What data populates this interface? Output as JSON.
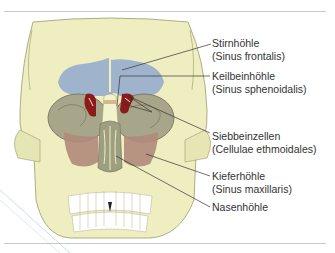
{
  "figure": {
    "labels": [
      {
        "id": "stirnhoehle",
        "name": "Stirnhöhle",
        "latin": "(Sinus frontalis)"
      },
      {
        "id": "keilbeinhoehle",
        "name": "Keilbeinhöhle",
        "latin": "(Sinus sphenoidalis)"
      },
      {
        "id": "siebbeinzellen",
        "name": "Siebbeinzellen",
        "latin": "(Cellulae ethmoidales)"
      },
      {
        "id": "kieferhoehle",
        "name": "Kieferhöhle",
        "latin": "(Sinus maxillaris)"
      },
      {
        "id": "nasenhoehle",
        "name": "Nasenhöhle",
        "latin": ""
      }
    ],
    "colors": {
      "bone": "#eeeec0",
      "bone_shadow": "#d6d6a0",
      "frontal_sinus": "#9fb4cc",
      "sphenoid_sinus": "#8b1a1a",
      "orbit": "#a8a68a",
      "maxillary_sinus": "#b08a7a",
      "nasal_cavity": "#9e9e80",
      "leader_line": "#333333",
      "rule": "#c8c8c8"
    }
  }
}
